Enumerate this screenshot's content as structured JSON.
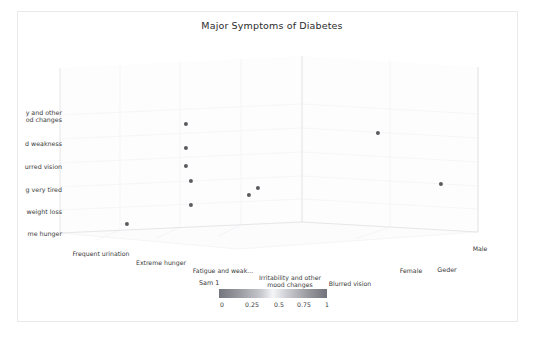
{
  "figure": {
    "title": "Major Symptoms of Diabetes",
    "background": "#ffffff",
    "frame_color": "#e9e9e9",
    "text_color": "#3a3a3a",
    "point_color": "#5b5b5f",
    "grid_color": "#f2f2f4"
  },
  "chart_data": {
    "type": "scatter",
    "title": "Major Symptoms of Diabetes",
    "projection": "3d",
    "xlabel": "",
    "ylabel": "",
    "zlabel": "Geder",
    "grid": true,
    "legend_position": "bottom-center",
    "x_categories": [
      "Frequent urination",
      "Extreme hunger",
      "Fatigue and weak...",
      "Irritability and other\nmood changes",
      "Blurred vision"
    ],
    "y_categories": [
      "me hunger",
      "weight loss",
      "g very tired",
      "urred vision",
      "d weakness",
      "y and other\nod changes"
    ],
    "y_categories_full": [
      "Extreme hunger",
      "Unexplained weight loss",
      "Feeling very tired",
      "Blurred vision",
      "Fatigue and weakness",
      "Irritability and other mood changes"
    ],
    "z_categories": [
      "Female",
      "Male"
    ],
    "colorbar": {
      "label": "Sam 1",
      "ticks": [
        "0",
        "0.25",
        "0.5",
        "0.75",
        "1"
      ],
      "vmin": 0,
      "vmax": 1,
      "colormap": "gray-blue"
    },
    "points": [
      {
        "x": "Frequent urination",
        "y": "Extreme hunger",
        "z": "Female",
        "value": 0.1,
        "px": 127,
        "py": 224
      },
      {
        "x": "Fatigue and weak...",
        "y": "Irritability and other mood changes",
        "z": "Female",
        "value": 0.95,
        "px": 186,
        "py": 124
      },
      {
        "x": "Fatigue and weak...",
        "y": "Fatigue and weakness",
        "z": "Female",
        "value": 0.8,
        "px": 186,
        "py": 148
      },
      {
        "x": "Fatigue and weak...",
        "y": "Blurred vision",
        "z": "Female",
        "value": 0.65,
        "px": 186,
        "py": 166
      },
      {
        "x": "Fatigue and weak...",
        "y": "Feeling very tired",
        "z": "Female",
        "value": 0.5,
        "px": 191,
        "py": 181
      },
      {
        "x": "Fatigue and weak...",
        "y": "Unexplained weight loss",
        "z": "Female",
        "value": 0.3,
        "px": 191,
        "py": 205
      },
      {
        "x": "Irritability and other mood changes",
        "y": "Feeling very tired",
        "z": "Female",
        "value": 0.45,
        "px": 249,
        "py": 195
      },
      {
        "x": "Blurred vision",
        "y": "Feeling very tired",
        "z": "Female",
        "value": 0.55,
        "px": 258,
        "py": 188
      },
      {
        "x": "Fatigue and weak...",
        "y": "Irritability and other mood changes",
        "z": "Male",
        "value": 0.9,
        "px": 378,
        "py": 133
      },
      {
        "x": "Blurred vision",
        "y": "Feeling very tired",
        "z": "Male",
        "value": 0.55,
        "px": 441,
        "py": 184
      }
    ]
  },
  "ylabels": [
    {
      "text": "y and other\nod changes",
      "top": 109
    },
    {
      "text": "d weakness",
      "top": 140
    },
    {
      "text": "urred vision",
      "top": 163
    },
    {
      "text": "g very tired",
      "top": 186
    },
    {
      "text": "weight loss",
      "top": 208
    },
    {
      "text": "me hunger",
      "top": 230
    }
  ],
  "xlabels": [
    {
      "text": "Frequent urination",
      "left": 101,
      "top": 250
    },
    {
      "text": "Extreme hunger",
      "left": 161,
      "top": 259
    },
    {
      "text": "Fatigue and weak...",
      "left": 223,
      "top": 267
    },
    {
      "text": "Irritability and other\nmood changes",
      "left": 290,
      "top": 274
    },
    {
      "text": "Blurred vision",
      "left": 350,
      "top": 280
    }
  ],
  "zlabels": [
    {
      "text": "Male",
      "left": 480,
      "top": 245
    },
    {
      "text": "Female",
      "left": 411,
      "top": 267
    },
    {
      "text": "Geder",
      "left": 447,
      "top": 266
    }
  ],
  "colorbar_ticks": [
    {
      "text": "0",
      "left": 222
    },
    {
      "text": "0.25",
      "left": 252
    },
    {
      "text": "0.5",
      "left": 279
    },
    {
      "text": "0.75",
      "left": 304
    },
    {
      "text": "1",
      "left": 327
    }
  ],
  "colorbar_label": {
    "text": "Sam 1",
    "left": 199,
    "top": 279
  }
}
